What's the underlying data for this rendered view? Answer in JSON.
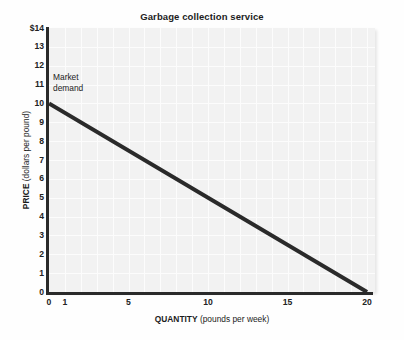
{
  "chart_data": {
    "type": "line",
    "title": "Garbage collection service",
    "xlabel_bold": "QUANTITY",
    "xlabel_rest": "(pounds per week)",
    "ylabel_bold": "PRICE",
    "ylabel_rest": "(dollars per pound)",
    "xlim": [
      0,
      20.5
    ],
    "ylim": [
      0,
      14
    ],
    "grid": true,
    "legend_position": "none",
    "xticks": [
      {
        "value": 0,
        "label": "0"
      },
      {
        "value": 1,
        "label": "1"
      },
      {
        "value": 5,
        "label": "5"
      },
      {
        "value": 10,
        "label": "10"
      },
      {
        "value": 15,
        "label": "15"
      },
      {
        "value": 20,
        "label": "20"
      }
    ],
    "yticks": [
      {
        "value": 14,
        "label": "$14"
      },
      {
        "value": 13,
        "label": "13"
      },
      {
        "value": 12,
        "label": "12"
      },
      {
        "value": 11,
        "label": "11"
      },
      {
        "value": 10,
        "label": "10"
      },
      {
        "value": 9,
        "label": "9"
      },
      {
        "value": 8,
        "label": "8"
      },
      {
        "value": 7,
        "label": "7"
      },
      {
        "value": 6,
        "label": "6"
      },
      {
        "value": 5,
        "label": "5"
      },
      {
        "value": 4,
        "label": "4"
      },
      {
        "value": 3,
        "label": "3"
      },
      {
        "value": 2,
        "label": "2"
      },
      {
        "value": 1,
        "label": "1"
      },
      {
        "value": 0,
        "label": "0"
      }
    ],
    "gridlines": {
      "x": [
        1,
        2,
        3,
        4,
        5,
        6,
        7,
        8,
        9,
        10,
        11,
        12,
        13,
        14,
        15,
        16,
        17,
        18,
        19,
        20
      ],
      "y": [
        1,
        2,
        3,
        4,
        5,
        6,
        7,
        8,
        9,
        10,
        11,
        12,
        13
      ]
    },
    "series": [
      {
        "name": "Market demand",
        "color": "#2a2a2a",
        "width": 4,
        "x": [
          0,
          20
        ],
        "y": [
          10,
          0
        ]
      }
    ],
    "annotations": [
      {
        "name": "market-demand-label",
        "line1": "Market",
        "line2": "demand"
      }
    ]
  }
}
